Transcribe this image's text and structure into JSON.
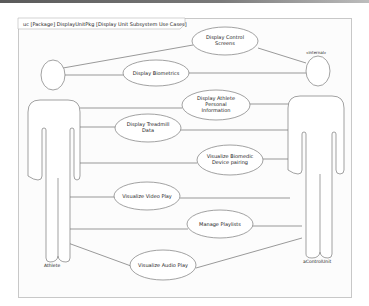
{
  "frame": {
    "title": "uc [Package] DisplayUnitPkg [Display Unit Subsystem Use Cases]"
  },
  "actors": [
    {
      "name": "Athlete",
      "stereotype": ""
    },
    {
      "name": "aControlUnit",
      "stereotype": "«internal»"
    }
  ],
  "use_cases": [
    {
      "id": "uc1",
      "line1": "Display Control",
      "line2": "Screens",
      "line3": ""
    },
    {
      "id": "uc2",
      "line1": "Display Biometrics",
      "line2": "",
      "line3": ""
    },
    {
      "id": "uc3",
      "line1": "Display Athlete",
      "line2": "Personal",
      "line3": "Information"
    },
    {
      "id": "uc4",
      "line1": "Display Treadmill",
      "line2": "Data",
      "line3": ""
    },
    {
      "id": "uc5",
      "line1": "Visualize Biomedic",
      "line2": "Device pairing",
      "line3": ""
    },
    {
      "id": "uc6",
      "line1": "Visualize Video Play",
      "line2": "",
      "line3": ""
    },
    {
      "id": "uc7",
      "line1": "Manage Playlists",
      "line2": "",
      "line3": ""
    },
    {
      "id": "uc8",
      "line1": "Visualize Audio Play",
      "line2": "",
      "line3": ""
    }
  ],
  "colors": {
    "line": "#6e6e6e",
    "shape_fill": "#ffffff",
    "frame_border": "#c8c8c8"
  }
}
